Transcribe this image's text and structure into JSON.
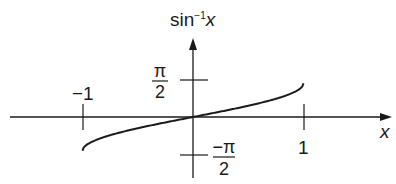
{
  "chart_data": {
    "type": "line",
    "title": "",
    "xlabel": "x",
    "ylabel": "sin⁻¹x",
    "ylabel_parts": {
      "base": "sin",
      "sup": "−1",
      "var": "x"
    },
    "xlim": [
      -1.1,
      1.1
    ],
    "ylim": [
      -1.5708,
      1.5708
    ],
    "grid": false,
    "legend": null,
    "x_ticks": [
      {
        "value": -1,
        "label": "−1"
      },
      {
        "value": 1,
        "label": "1"
      }
    ],
    "y_ticks": [
      {
        "value": 1.5708,
        "label_num": "π",
        "label_den": "2"
      },
      {
        "value": -1.5708,
        "label_num": "−π",
        "label_den": "2"
      }
    ],
    "series": [
      {
        "name": "arcsin(x)",
        "x": [
          -1,
          -0.95,
          -0.9,
          -0.8,
          -0.6,
          -0.4,
          -0.2,
          0,
          0.2,
          0.4,
          0.6,
          0.8,
          0.9,
          0.95,
          1
        ],
        "values": [
          -1.5708,
          -1.2532,
          -1.1198,
          -0.9273,
          -0.6435,
          -0.4115,
          -0.2014,
          0,
          0.2014,
          0.4115,
          0.6435,
          0.9273,
          1.1198,
          1.2532,
          1.5708
        ]
      }
    ]
  },
  "labels": {
    "x_axis": "x",
    "y_axis_base": "sin",
    "y_axis_sup": "−1",
    "y_axis_var": "x",
    "tick_x_neg1": "−1",
    "tick_x_pos1": "1",
    "tick_y_pos_num": "π",
    "tick_y_pos_den": "2",
    "tick_y_neg_num": "−π",
    "tick_y_neg_den": "2"
  },
  "colors": {
    "ink": "#1a1a1a",
    "background": "#ffffff"
  }
}
